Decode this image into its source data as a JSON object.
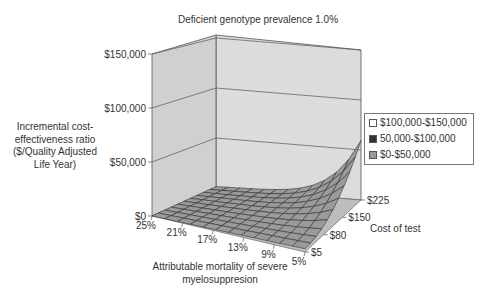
{
  "chart_data": {
    "type": "surface3d",
    "title": "Deficient genotype prevalence 1.0%",
    "zlabel": "Incremental cost-effectiveness ratio ($/Quality Adjusted Life Year)",
    "xlabel": "Attributable mortality of severe myelosuppresion",
    "ylabel": "Cost of test",
    "z_ticks": [
      "$0",
      "$50,000",
      "$100,000",
      "$150,000"
    ],
    "zlim": [
      0,
      150000
    ],
    "x_ticks": [
      "25%",
      "21%",
      "17%",
      "13%",
      "9%",
      "5%"
    ],
    "y_ticks": [
      "$5",
      "$80",
      "$150",
      "$225"
    ],
    "legend": [
      {
        "label": "$100,000-$150,000",
        "color": "#ffffff"
      },
      {
        "label": "50,000-$100,000",
        "color": "#333333"
      },
      {
        "label": "$0-$50,000",
        "color": "#999999"
      }
    ],
    "legend_position": "right",
    "surface_description": "Near-flat surface close to $0 across most of the grid, rising sharply toward ~$62,000 at low mortality (5%) and high test cost ($225)",
    "corner_values": {
      "25%_$5": 0,
      "25%_$225": 5000,
      "5%_$5": 8000,
      "5%_$225": 62000
    }
  }
}
